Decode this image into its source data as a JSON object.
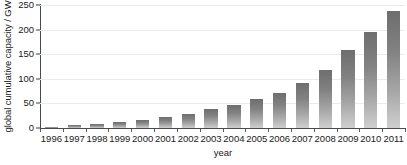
{
  "chart_data": {
    "type": "bar",
    "title": "",
    "subtitle": "",
    "xlabel": "year",
    "ylabel": "global cumulative capacity / GW",
    "categories": [
      "1996",
      "1997",
      "1998",
      "1999",
      "2000",
      "2001",
      "2002",
      "2003",
      "2004",
      "2005",
      "2006",
      "2007",
      "2008",
      "2009",
      "2010",
      "2011"
    ],
    "values": [
      3,
      6,
      8,
      12,
      16,
      22,
      29,
      38,
      46,
      58,
      72,
      92,
      118,
      158,
      195,
      238
    ],
    "series": [
      {
        "name": "global cumulative capacity",
        "values": [
          3,
          6,
          8,
          12,
          16,
          22,
          29,
          38,
          46,
          58,
          72,
          92,
          118,
          158,
          195,
          238
        ]
      }
    ],
    "ylim": [
      0,
      250
    ],
    "yticks": [
      0,
      50,
      100,
      150,
      200,
      250
    ],
    "ytick_labels": [
      "0",
      "50",
      "100",
      "150",
      "200",
      "250"
    ],
    "xtick_labels": [
      "1996",
      "1997",
      "1998",
      "1999",
      "2000",
      "2001",
      "2002",
      "2003",
      "2004",
      "2005",
      "2006",
      "2007",
      "2008",
      "2009",
      "2010",
      "2011"
    ],
    "grid": true,
    "grid_axis": "y",
    "legend": false,
    "legend_position": "none",
    "annotations": [],
    "colors": {
      "bar_top": "#6e6e6e",
      "bar_bottom": "#cfcfcf",
      "axis": "#4a4a4a",
      "gridline": "#ebebeb",
      "text": "#1a1a1a",
      "background": "#ffffff"
    }
  }
}
